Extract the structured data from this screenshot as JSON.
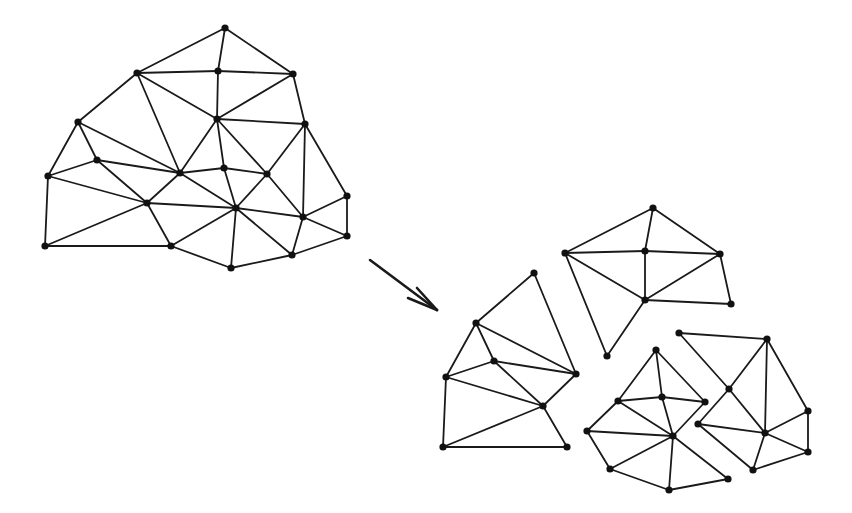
{
  "diagram": {
    "colors": {
      "stroke": "#1a1a1a",
      "node": "#111111",
      "background": "#ffffff"
    },
    "node_radius": 3.6,
    "meshes": [
      {
        "name": "original-mesh",
        "nodes": {
          "A": [
            225,
            28
          ],
          "B": [
            137,
            73
          ],
          "C": [
            218,
            71
          ],
          "D": [
            293,
            74
          ],
          "E": [
            78,
            122
          ],
          "F": [
            217,
            119
          ],
          "G": [
            305,
            124
          ],
          "H": [
            97,
            160
          ],
          "I": [
            180,
            173
          ],
          "J": [
            224,
            168
          ],
          "K": [
            267,
            174
          ],
          "L": [
            48,
            176
          ],
          "M": [
            147,
            203
          ],
          "N": [
            236,
            208
          ],
          "O": [
            347,
            196
          ],
          "P": [
            303,
            217
          ],
          "Q": [
            347,
            236
          ],
          "R": [
            45,
            246
          ],
          "S": [
            171,
            246
          ],
          "T": [
            292,
            255
          ],
          "U": [
            231,
            268
          ]
        },
        "edges": [
          [
            "A",
            "B"
          ],
          [
            "A",
            "C"
          ],
          [
            "A",
            "D"
          ],
          [
            "B",
            "C"
          ],
          [
            "C",
            "D"
          ],
          [
            "B",
            "E"
          ],
          [
            "B",
            "I"
          ],
          [
            "B",
            "F"
          ],
          [
            "C",
            "F"
          ],
          [
            "D",
            "F"
          ],
          [
            "D",
            "G"
          ],
          [
            "F",
            "G"
          ],
          [
            "F",
            "I"
          ],
          [
            "F",
            "J"
          ],
          [
            "F",
            "K"
          ],
          [
            "G",
            "K"
          ],
          [
            "G",
            "P"
          ],
          [
            "G",
            "O"
          ],
          [
            "E",
            "L"
          ],
          [
            "E",
            "H"
          ],
          [
            "E",
            "I"
          ],
          [
            "H",
            "L"
          ],
          [
            "H",
            "I"
          ],
          [
            "H",
            "M"
          ],
          [
            "I",
            "J"
          ],
          [
            "J",
            "K"
          ],
          [
            "I",
            "M"
          ],
          [
            "I",
            "N"
          ],
          [
            "J",
            "N"
          ],
          [
            "K",
            "N"
          ],
          [
            "K",
            "P"
          ],
          [
            "L",
            "M"
          ],
          [
            "L",
            "R"
          ],
          [
            "M",
            "N"
          ],
          [
            "M",
            "R"
          ],
          [
            "M",
            "S"
          ],
          [
            "N",
            "P"
          ],
          [
            "N",
            "S"
          ],
          [
            "N",
            "U"
          ],
          [
            "N",
            "T"
          ],
          [
            "P",
            "O"
          ],
          [
            "O",
            "Q"
          ],
          [
            "P",
            "Q"
          ],
          [
            "P",
            "T"
          ],
          [
            "Q",
            "T"
          ],
          [
            "T",
            "U"
          ],
          [
            "S",
            "U"
          ],
          [
            "R",
            "S"
          ]
        ]
      },
      {
        "name": "partition-left",
        "nodes": {
          "a": [
            534,
            273
          ],
          "b": [
            476,
            323
          ],
          "c": [
            494,
            361
          ],
          "d": [
            446,
            377
          ],
          "e": [
            576,
            374
          ],
          "f": [
            543,
            406
          ],
          "g": [
            443,
            447
          ],
          "h": [
            567,
            447
          ]
        },
        "edges": [
          [
            "a",
            "b"
          ],
          [
            "a",
            "e"
          ],
          [
            "b",
            "d"
          ],
          [
            "b",
            "c"
          ],
          [
            "b",
            "e"
          ],
          [
            "c",
            "d"
          ],
          [
            "c",
            "e"
          ],
          [
            "c",
            "f"
          ],
          [
            "d",
            "f"
          ],
          [
            "d",
            "g"
          ],
          [
            "e",
            "f"
          ],
          [
            "f",
            "g"
          ],
          [
            "f",
            "h"
          ],
          [
            "g",
            "h"
          ]
        ]
      },
      {
        "name": "partition-top",
        "nodes": {
          "a": [
            653,
            208
          ],
          "b": [
            565,
            253
          ],
          "c": [
            645,
            251
          ],
          "d": [
            720,
            254
          ],
          "e": [
            645,
            300
          ],
          "f": [
            731,
            304
          ],
          "g": [
            607,
            356
          ]
        },
        "edges": [
          [
            "a",
            "b"
          ],
          [
            "a",
            "c"
          ],
          [
            "a",
            "d"
          ],
          [
            "b",
            "c"
          ],
          [
            "c",
            "d"
          ],
          [
            "b",
            "e"
          ],
          [
            "c",
            "e"
          ],
          [
            "d",
            "e"
          ],
          [
            "d",
            "f"
          ],
          [
            "e",
            "f"
          ],
          [
            "b",
            "g"
          ],
          [
            "e",
            "g"
          ]
        ]
      },
      {
        "name": "partition-bottom",
        "nodes": {
          "a": [
            656,
            350
          ],
          "b": [
            618,
            401
          ],
          "c": [
            662,
            397
          ],
          "d": [
            705,
            402
          ],
          "e": [
            587,
            431
          ],
          "f": [
            673,
            436
          ],
          "g": [
            610,
            469
          ],
          "h": [
            728,
            479
          ],
          "i": [
            669,
            490
          ]
        },
        "edges": [
          [
            "a",
            "b"
          ],
          [
            "a",
            "c"
          ],
          [
            "a",
            "d"
          ],
          [
            "b",
            "c"
          ],
          [
            "c",
            "d"
          ],
          [
            "b",
            "e"
          ],
          [
            "b",
            "f"
          ],
          [
            "c",
            "f"
          ],
          [
            "d",
            "f"
          ],
          [
            "e",
            "f"
          ],
          [
            "e",
            "g"
          ],
          [
            "g",
            "f"
          ],
          [
            "f",
            "i"
          ],
          [
            "f",
            "h"
          ],
          [
            "g",
            "i"
          ],
          [
            "i",
            "h"
          ]
        ]
      },
      {
        "name": "partition-right",
        "nodes": {
          "a": [
            679,
            333
          ],
          "b": [
            767,
            339
          ],
          "c": [
            729,
            389
          ],
          "d": [
            698,
            424
          ],
          "e": [
            765,
            433
          ],
          "f": [
            808,
            411
          ],
          "g": [
            808,
            452
          ],
          "h": [
            753,
            470
          ]
        },
        "edges": [
          [
            "a",
            "b"
          ],
          [
            "a",
            "c"
          ],
          [
            "b",
            "c"
          ],
          [
            "b",
            "e"
          ],
          [
            "b",
            "f"
          ],
          [
            "c",
            "d"
          ],
          [
            "c",
            "e"
          ],
          [
            "d",
            "e"
          ],
          [
            "d",
            "h"
          ],
          [
            "e",
            "h"
          ],
          [
            "e",
            "f"
          ],
          [
            "e",
            "g"
          ],
          [
            "f",
            "g"
          ],
          [
            "h",
            "g"
          ]
        ]
      }
    ],
    "arrow": {
      "from": [
        370,
        260
      ],
      "to": [
        437,
        310
      ],
      "barbs": [
        [
          417,
          288
        ],
        [
          408,
          298
        ]
      ]
    }
  }
}
